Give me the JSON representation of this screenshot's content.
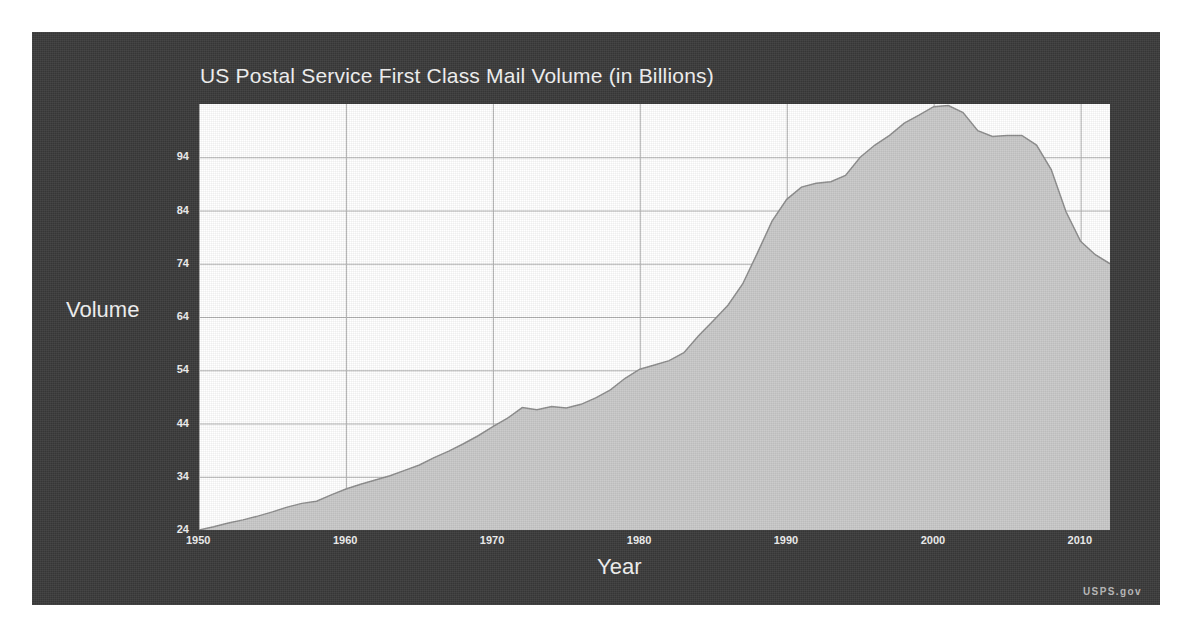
{
  "source_label": "USPS.gov",
  "chart_data": {
    "type": "area",
    "title": "US Postal Service First Class Mail Volume (in Billions)",
    "xlabel": "Year",
    "ylabel": "Volume",
    "xlim": [
      1950,
      2012
    ],
    "ylim": [
      24,
      104
    ],
    "grid": true,
    "legend": "none",
    "xticks": [
      1950,
      1960,
      1970,
      1980,
      1990,
      2000,
      2010
    ],
    "yticks": [
      24,
      34,
      44,
      54,
      64,
      74,
      84,
      94
    ],
    "fill_color": "#c9c9c9",
    "line_color": "#8d8d8d",
    "plot_background": "#ffffff",
    "panel_background": "#3a3a3a",
    "text_color": "#f2f2f2",
    "grid_color": "#b0b0b0",
    "series": [
      {
        "name": "First Class Mail Volume",
        "x": [
          1950,
          1951,
          1952,
          1953,
          1954,
          1955,
          1956,
          1957,
          1958,
          1959,
          1960,
          1961,
          1962,
          1963,
          1964,
          1965,
          1966,
          1967,
          1968,
          1969,
          1970,
          1971,
          1972,
          1973,
          1974,
          1975,
          1976,
          1977,
          1978,
          1979,
          1980,
          1981,
          1982,
          1983,
          1984,
          1985,
          1986,
          1987,
          1988,
          1989,
          1990,
          1991,
          1992,
          1993,
          1994,
          1995,
          1996,
          1997,
          1998,
          1999,
          2000,
          2001,
          2002,
          2003,
          2004,
          2005,
          2006,
          2007,
          2008,
          2009,
          2010,
          2011,
          2012
        ],
        "values": [
          24.0,
          24.6,
          25.3,
          25.9,
          26.6,
          27.4,
          28.3,
          29.0,
          29.4,
          30.6,
          31.7,
          32.6,
          33.4,
          34.2,
          35.2,
          36.2,
          37.6,
          38.8,
          40.2,
          41.7,
          43.4,
          45.0,
          47.0,
          46.6,
          47.2,
          46.9,
          47.6,
          48.8,
          50.3,
          52.5,
          54.2,
          55.0,
          55.8,
          57.3,
          60.5,
          63.3,
          66.2,
          70.2,
          76.0,
          82.0,
          86.1,
          88.4,
          89.1,
          89.4,
          90.6,
          94.0,
          96.3,
          98.1,
          100.4,
          101.9,
          103.5,
          103.7,
          102.4,
          99.0,
          97.9,
          98.1,
          98.1,
          96.3,
          91.7,
          83.8,
          78.2,
          75.7,
          74.0
        ]
      }
    ],
    "annotations": [
      {
        "text": "Peak volume near 2001 at about 103.7 billion pieces"
      },
      {
        "text": "Plateau and slight dip around 1971-1975"
      },
      {
        "text": "Steep decline after 2007 to about 74 billion by 2012"
      }
    ]
  }
}
